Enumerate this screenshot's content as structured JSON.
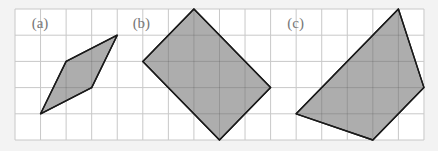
{
  "figure": {
    "grid": {
      "origin_x": 15,
      "origin_y": 9,
      "cell_w": 25.56,
      "cell_h": 26.2,
      "cols": 16,
      "rows": 5,
      "line_color": "#c8c8c8",
      "background": "#ffffff"
    },
    "shape_fill": "#a9a9a9",
    "shape_stroke": "#1a1a1a",
    "panels": [
      {
        "label": "(a)",
        "label_pos": [
          1.2,
          0.7
        ],
        "vertices": [
          [
            1,
            4
          ],
          [
            2,
            2
          ],
          [
            4,
            1
          ],
          [
            3,
            3
          ]
        ]
      },
      {
        "label": "(b)",
        "label_pos": [
          5.15,
          0.7
        ],
        "vertices": [
          [
            7,
            0
          ],
          [
            10,
            3
          ],
          [
            8,
            5
          ],
          [
            5,
            2
          ]
        ]
      },
      {
        "label": "(c)",
        "label_pos": [
          11.2,
          0.7
        ],
        "vertices": [
          [
            15,
            0
          ],
          [
            16,
            3
          ],
          [
            14,
            5
          ],
          [
            11,
            4
          ]
        ]
      }
    ]
  }
}
